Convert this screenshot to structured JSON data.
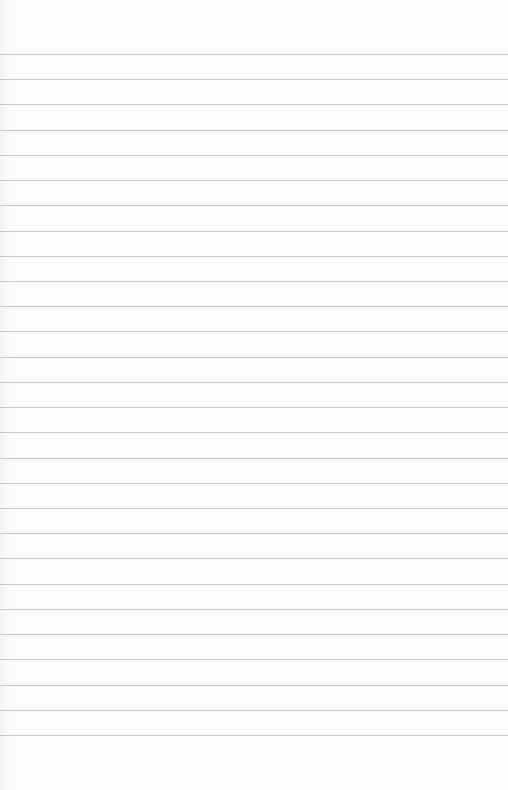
{
  "paper": {
    "type": "lined-paper",
    "background_color": "#fdfdfd",
    "rule_color": "#c9c9c9",
    "first_rule_y": 54,
    "rule_spacing": 25.22,
    "rule_count": 28
  }
}
